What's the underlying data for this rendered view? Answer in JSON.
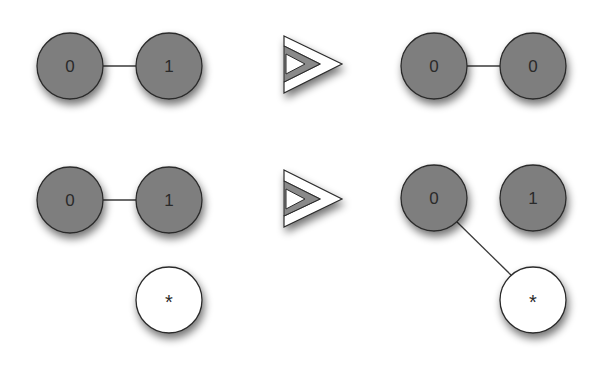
{
  "colors": {
    "filled_node": "#7e7e7e",
    "empty_node": "#ffffff",
    "stroke": "#2b2b2b",
    "edge": "#3a3a3a",
    "arrow_fill": "#ffffff",
    "arrow_inner": "#8a8a8a"
  },
  "rows": [
    {
      "left": {
        "nodes": [
          {
            "id": "a",
            "label": "0",
            "type": "filled"
          },
          {
            "id": "b",
            "label": "1",
            "type": "filled"
          }
        ],
        "edges": [
          [
            "a",
            "b"
          ]
        ]
      },
      "arrow": "double-chevron-right-icon",
      "right": {
        "nodes": [
          {
            "id": "a",
            "label": "0",
            "type": "filled"
          },
          {
            "id": "b",
            "label": "0",
            "type": "filled"
          }
        ],
        "edges": [
          [
            "a",
            "b"
          ]
        ]
      }
    },
    {
      "left": {
        "nodes": [
          {
            "id": "a",
            "label": "0",
            "type": "filled"
          },
          {
            "id": "b",
            "label": "1",
            "type": "filled"
          },
          {
            "id": "c",
            "label": "*",
            "type": "empty"
          }
        ],
        "edges": [
          [
            "a",
            "b"
          ]
        ]
      },
      "arrow": "double-chevron-right-icon",
      "right": {
        "nodes": [
          {
            "id": "a",
            "label": "0",
            "type": "filled"
          },
          {
            "id": "b",
            "label": "1",
            "type": "filled"
          },
          {
            "id": "c",
            "label": "*",
            "type": "empty"
          }
        ],
        "edges": [
          [
            "a",
            "c"
          ]
        ]
      }
    }
  ]
}
